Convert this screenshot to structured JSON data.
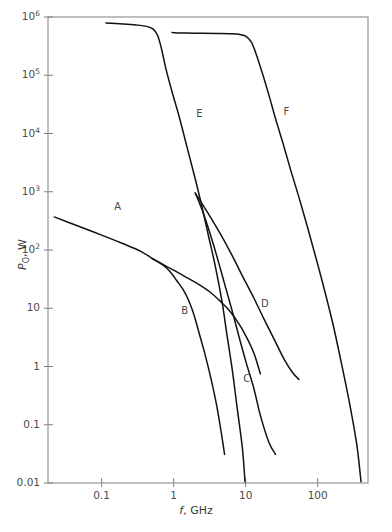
{
  "figure": {
    "background": "#ffffff",
    "frame_color": "#808080",
    "curve_color": "#111111",
    "text_color": "#3a3a3a"
  },
  "axes": {
    "x_title_symbol": "f",
    "x_title_rest": ", GHz",
    "y_title_symbol": "P",
    "y_title_sub": "O",
    "y_title_rest": ", W",
    "x_tick_labels": [
      "0.1",
      "1",
      "10",
      "100"
    ],
    "x_tick_values": [
      0.1,
      1,
      10,
      100
    ],
    "y_tick_labels": [
      "0.01",
      "0.1",
      "1",
      "10",
      "10²",
      "10³",
      "10⁴",
      "10⁵",
      "10⁶"
    ],
    "y_tick_values": [
      0.01,
      0.1,
      1,
      10,
      100,
      1000,
      10000,
      100000,
      1000000
    ]
  },
  "chart_data": {
    "type": "line",
    "title": "",
    "xlabel": "f, GHz",
    "ylabel": "P_O, W",
    "xscale": "log",
    "yscale": "log",
    "xlim": [
      0.018,
      500
    ],
    "ylim": [
      0.01,
      1000000
    ],
    "grid": false,
    "legend": "inline-curve-labels",
    "series": [
      {
        "name": "A",
        "label": "A",
        "label_x": 0.17,
        "label_y": 550,
        "points": [
          [
            0.022,
            370
          ],
          [
            0.05,
            250
          ],
          [
            0.1,
            180
          ],
          [
            0.2,
            128
          ],
          [
            0.35,
            95
          ],
          [
            0.5,
            72
          ],
          [
            0.7,
            57
          ],
          [
            1.0,
            45
          ],
          [
            1.5,
            34
          ],
          [
            2.2,
            26
          ],
          [
            3.2,
            19
          ],
          [
            4.5,
            13
          ],
          [
            6.0,
            9.0
          ],
          [
            8.0,
            5.5
          ],
          [
            10.0,
            3.4
          ],
          [
            13.0,
            1.7
          ],
          [
            16.0,
            0.75
          ]
        ]
      },
      {
        "name": "B",
        "label": "B",
        "label_x": 1.45,
        "label_y": 9.0,
        "points": [
          [
            0.5,
            72
          ],
          [
            0.7,
            56
          ],
          [
            0.9,
            42
          ],
          [
            1.1,
            30
          ],
          [
            1.35,
            21
          ],
          [
            1.6,
            14
          ],
          [
            1.9,
            8.0
          ],
          [
            2.2,
            4.2
          ],
          [
            2.7,
            1.7
          ],
          [
            3.3,
            0.62
          ],
          [
            4.0,
            0.2
          ],
          [
            4.7,
            0.06
          ],
          [
            5.1,
            0.031
          ]
        ]
      },
      {
        "name": "C",
        "label": "C",
        "label_x": 10.5,
        "label_y": 0.62,
        "points": [
          [
            2.0,
            950
          ],
          [
            2.6,
            420
          ],
          [
            3.3,
            170
          ],
          [
            4.2,
            62
          ],
          [
            5.2,
            24
          ],
          [
            6.5,
            9.0
          ],
          [
            8.0,
            3.4
          ],
          [
            10.0,
            1.25
          ],
          [
            13.0,
            0.42
          ],
          [
            16.0,
            0.145
          ],
          [
            21.0,
            0.05
          ],
          [
            26.0,
            0.031
          ]
        ]
      },
      {
        "name": "D",
        "label": "D",
        "label_x": 18.5,
        "label_y": 12,
        "points": [
          [
            2.0,
            950
          ],
          [
            3.0,
            430
          ],
          [
            4.5,
            185
          ],
          [
            6.5,
            80
          ],
          [
            9.0,
            36
          ],
          [
            13.0,
            15
          ],
          [
            18.0,
            6.5
          ],
          [
            25.0,
            2.9
          ],
          [
            34.0,
            1.35
          ],
          [
            45.0,
            0.78
          ],
          [
            55.0,
            0.6
          ]
        ]
      },
      {
        "name": "E",
        "label": "E",
        "label_x": 2.35,
        "label_y": 22000,
        "points": [
          [
            0.115,
            790000
          ],
          [
            0.2,
            760000
          ],
          [
            0.3,
            730000
          ],
          [
            0.42,
            690000
          ],
          [
            0.52,
            620000
          ],
          [
            0.6,
            480000
          ],
          [
            0.68,
            280000
          ],
          [
            0.78,
            130000
          ],
          [
            0.95,
            52000
          ],
          [
            1.2,
            19000
          ],
          [
            1.5,
            6500
          ],
          [
            1.9,
            2100
          ],
          [
            2.4,
            650
          ],
          [
            3.0,
            190
          ],
          [
            3.8,
            52
          ],
          [
            4.7,
            13
          ],
          [
            5.5,
            3.5
          ],
          [
            6.5,
            0.9
          ],
          [
            7.6,
            0.2
          ],
          [
            9.0,
            0.04
          ],
          [
            9.8,
            0.0105
          ]
        ]
      },
      {
        "name": "F",
        "label": "F",
        "label_x": 38,
        "label_y": 23000,
        "points": [
          [
            0.95,
            540000
          ],
          [
            1.5,
            530000
          ],
          [
            2.5,
            525000
          ],
          [
            4.0,
            520000
          ],
          [
            6.0,
            515000
          ],
          [
            8.0,
            505000
          ],
          [
            10.0,
            470000
          ],
          [
            12.0,
            370000
          ],
          [
            14.0,
            230000
          ],
          [
            17.0,
            110000
          ],
          [
            21.0,
            46000
          ],
          [
            26.0,
            18000
          ],
          [
            33.0,
            6800
          ],
          [
            42.0,
            2400
          ],
          [
            55.0,
            800
          ],
          [
            72.0,
            250
          ],
          [
            95.0,
            72
          ],
          [
            125.0,
            20
          ],
          [
            165.0,
            5.0
          ],
          [
            215.0,
            1.1
          ],
          [
            280.0,
            0.22
          ],
          [
            350.0,
            0.045
          ],
          [
            400.0,
            0.0105
          ]
        ]
      }
    ]
  }
}
